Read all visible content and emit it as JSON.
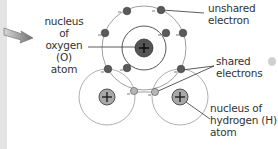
{
  "diagram": {
    "labels": {
      "oxygen_nucleus": [
        "nucleus of",
        "oxygen (O)",
        "atom"
      ],
      "unshared_electron": [
        "unshared",
        "electron"
      ],
      "shared_electrons": [
        "shared",
        "electrons"
      ],
      "hydrogen_nucleus": [
        "nucleus of",
        "hydrogen (H)",
        "atom"
      ]
    },
    "symbols": {
      "nucleus_charge": "+",
      "electron_charge": "-"
    },
    "colors": {
      "oxygen_nucleus": "#555555",
      "hydrogen_nucleus": "#a8a8a8",
      "oxygen_electron": "#5a5a5a",
      "shared_electron": "#b5b5b5",
      "shell_line": "#8a8a8a",
      "arrow": "#7a7a7a"
    }
  }
}
